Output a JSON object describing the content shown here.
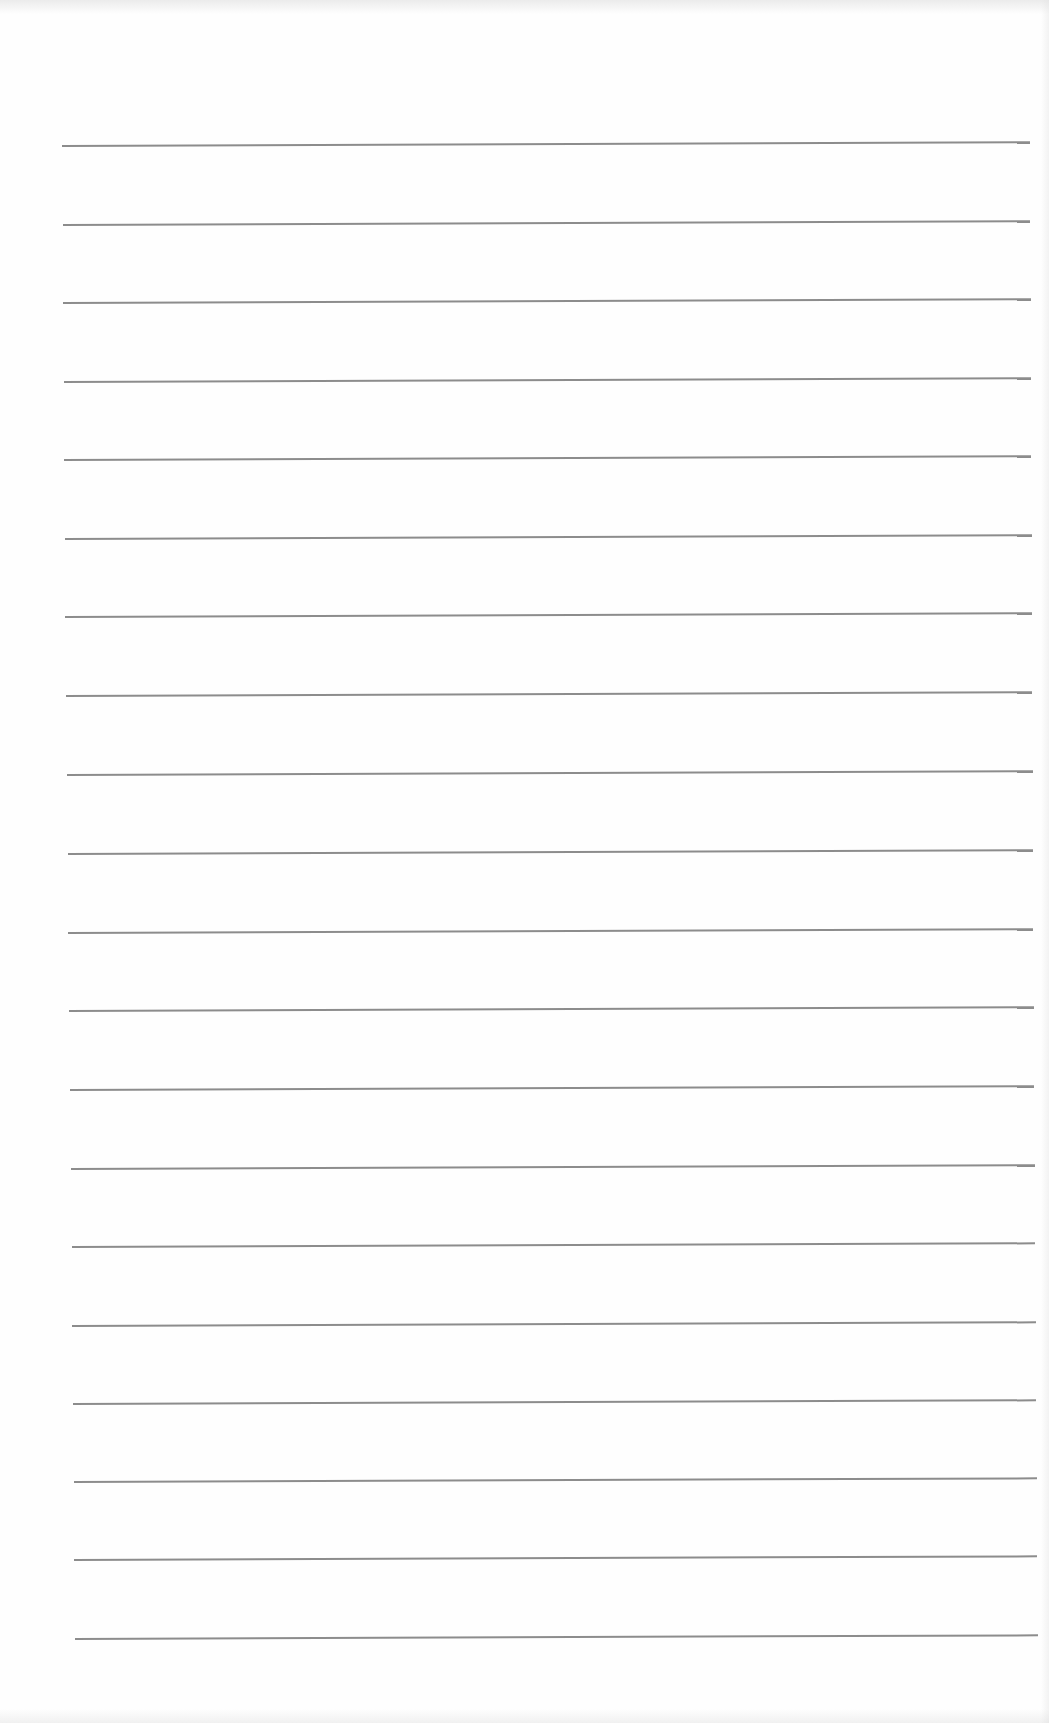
{
  "page": {
    "type": "lined-notebook-paper",
    "background_color": "#fefefe",
    "rule_color": "#8c8c8c",
    "rule_thickness_px": 2,
    "rule_count": 20,
    "rules": [
      {
        "y": 146,
        "x_start": 62,
        "x_end": 1030
      },
      {
        "y": 225,
        "x_start": 63,
        "x_end": 1030
      },
      {
        "y": 303,
        "x_start": 63,
        "x_end": 1031
      },
      {
        "y": 382,
        "x_start": 64,
        "x_end": 1031
      },
      {
        "y": 460,
        "x_start": 64,
        "x_end": 1031
      },
      {
        "y": 539,
        "x_start": 65,
        "x_end": 1032
      },
      {
        "y": 617,
        "x_start": 65,
        "x_end": 1032
      },
      {
        "y": 696,
        "x_start": 66,
        "x_end": 1032
      },
      {
        "y": 775,
        "x_start": 67,
        "x_end": 1033
      },
      {
        "y": 854,
        "x_start": 68,
        "x_end": 1033
      },
      {
        "y": 933,
        "x_start": 68,
        "x_end": 1033
      },
      {
        "y": 1011,
        "x_start": 69,
        "x_end": 1034
      },
      {
        "y": 1090,
        "x_start": 70,
        "x_end": 1034
      },
      {
        "y": 1169,
        "x_start": 71,
        "x_end": 1035
      },
      {
        "y": 1247,
        "x_start": 72,
        "x_end": 1035
      },
      {
        "y": 1326,
        "x_start": 72,
        "x_end": 1036
      },
      {
        "y": 1404,
        "x_start": 73,
        "x_end": 1036
      },
      {
        "y": 1482,
        "x_start": 74,
        "x_end": 1037
      },
      {
        "y": 1560,
        "x_start": 74,
        "x_end": 1037
      },
      {
        "y": 1639,
        "x_start": 75,
        "x_end": 1038
      }
    ],
    "tilt_deg": -0.22
  }
}
